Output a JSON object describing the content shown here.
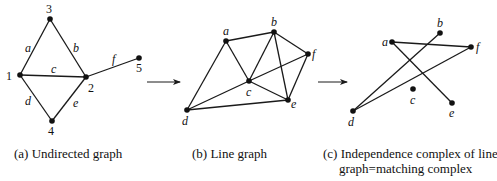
{
  "panels": {
    "a": {
      "caption": "(a) Undirected graph",
      "nodes": [
        {
          "id": "3",
          "x": 50,
          "y": 19,
          "lx": 46,
          "ly": 13
        },
        {
          "id": "1",
          "x": 20,
          "y": 75,
          "lx": 6,
          "ly": 80
        },
        {
          "id": "2",
          "x": 86,
          "y": 77,
          "lx": 88,
          "ly": 92
        },
        {
          "id": "4",
          "x": 52,
          "y": 121,
          "lx": 48,
          "ly": 135
        },
        {
          "id": "5",
          "x": 139,
          "y": 58,
          "lx": 136,
          "ly": 72
        }
      ],
      "edges": [
        {
          "label": "a",
          "from": "1",
          "to": "3",
          "lx": 25,
          "ly": 52
        },
        {
          "label": "b",
          "from": "3",
          "to": "2",
          "lx": 73,
          "ly": 52
        },
        {
          "label": "c",
          "from": "1",
          "to": "2",
          "lx": 51,
          "ly": 73
        },
        {
          "label": "d",
          "from": "1",
          "to": "4",
          "lx": 25,
          "ly": 105
        },
        {
          "label": "e",
          "from": "4",
          "to": "2",
          "lx": 73,
          "ly": 107
        },
        {
          "label": "f",
          "from": "2",
          "to": "5",
          "lx": 112,
          "ly": 63
        }
      ]
    },
    "b": {
      "caption": "(b) Line graph",
      "nodes": [
        {
          "id": "a",
          "x": 226,
          "y": 41,
          "lx": 223,
          "ly": 35
        },
        {
          "id": "b",
          "x": 274,
          "y": 32,
          "lx": 271,
          "ly": 26
        },
        {
          "id": "c",
          "x": 249,
          "y": 81,
          "lx": 246,
          "ly": 96
        },
        {
          "id": "d",
          "x": 187,
          "y": 110,
          "lx": 182,
          "ly": 125
        },
        {
          "id": "e",
          "x": 288,
          "y": 100,
          "lx": 291,
          "ly": 108
        },
        {
          "id": "f",
          "x": 308,
          "y": 54,
          "lx": 312,
          "ly": 58
        }
      ],
      "edges": [
        [
          "a",
          "b"
        ],
        [
          "a",
          "c"
        ],
        [
          "a",
          "d"
        ],
        [
          "b",
          "c"
        ],
        [
          "b",
          "e"
        ],
        [
          "b",
          "f"
        ],
        [
          "c",
          "d"
        ],
        [
          "c",
          "e"
        ],
        [
          "c",
          "f"
        ],
        [
          "d",
          "e"
        ],
        [
          "e",
          "f"
        ]
      ]
    },
    "c": {
      "caption_line1": "(c) Independence complex of line",
      "caption_line2": "graph=matching complex",
      "nodes": [
        {
          "id": "a",
          "x": 392,
          "y": 42,
          "lx": 382,
          "ly": 46
        },
        {
          "id": "b",
          "x": 440,
          "y": 33,
          "lx": 437,
          "ly": 27
        },
        {
          "id": "f",
          "x": 471,
          "y": 47,
          "lx": 476,
          "ly": 51
        },
        {
          "id": "c",
          "x": 413,
          "y": 89,
          "lx": 410,
          "ly": 104
        },
        {
          "id": "e",
          "x": 452,
          "y": 103,
          "lx": 449,
          "ly": 117
        },
        {
          "id": "d",
          "x": 353,
          "y": 111,
          "lx": 348,
          "ly": 126
        }
      ],
      "edges": [
        [
          "a",
          "f"
        ],
        [
          "a",
          "e"
        ],
        [
          "b",
          "d"
        ],
        [
          "d",
          "f"
        ]
      ]
    }
  },
  "arrows": [
    {
      "x1": 147,
      "y1": 82,
      "x2": 180,
      "y2": 82
    },
    {
      "x1": 318,
      "y1": 82,
      "x2": 347,
      "y2": 82
    }
  ],
  "colors": {
    "ink": "#1a1a1a",
    "background": "#ffffff"
  }
}
